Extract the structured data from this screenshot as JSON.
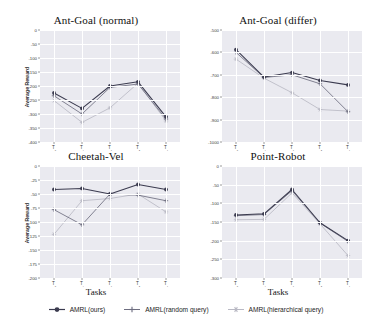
{
  "figure": {
    "background": "#ffffff",
    "panel_background": "#eaeaf0",
    "gridline_color": "#ffffff"
  },
  "legend": {
    "position": "bottom-center",
    "entries": [
      {
        "label": "AMRL(ours)",
        "color": "#3b3b4f",
        "marker": "circle"
      },
      {
        "label": "AMRL(random query)",
        "color": "#6e6e80",
        "marker": "plus"
      },
      {
        "label": "AMRL(hierarchical query)",
        "color": "#b9b9c4",
        "marker": "star"
      }
    ]
  },
  "chart_data": [
    {
      "id": "ant-goal-normal",
      "type": "line",
      "title": "Ant-Goal (normal)",
      "xlabel": "",
      "ylabel": "Average Reward",
      "categories": [
        "T₀",
        "T₁",
        "T₂",
        "T₃",
        "T₄"
      ],
      "tick_labels_x": [
        "T0",
        "T1",
        "T2",
        "T3",
        "T4"
      ],
      "ylim": [
        -400,
        0
      ],
      "yticks": [
        0,
        -50,
        -100,
        -150,
        -200,
        -250,
        -300,
        -350,
        -400
      ],
      "ytick_labels": [
        "0",
        "-50",
        "-100",
        "-150",
        "-200",
        "-250",
        "-300",
        "-350",
        "-400"
      ],
      "grid": true,
      "series": [
        {
          "name": "AMRL(ours)",
          "color": "#3b3b4f",
          "marker": "circle",
          "values": [
            -225,
            -280,
            -200,
            -185,
            -310
          ]
        },
        {
          "name": "AMRL(random query)",
          "color": "#6e6e80",
          "marker": "plus",
          "values": [
            -235,
            -300,
            -205,
            -193,
            -318
          ]
        },
        {
          "name": "AMRL(hierarchical query)",
          "color": "#b9b9c4",
          "marker": "star",
          "values": [
            -252,
            -330,
            -278,
            -190,
            -325
          ]
        }
      ]
    },
    {
      "id": "ant-goal-differ",
      "type": "line",
      "title": "Ant-Goal (differ)",
      "xlabel": "",
      "ylabel": "",
      "categories": [
        "T₀",
        "T₁",
        "T₂",
        "T₃",
        "T₄"
      ],
      "tick_labels_x": [
        "T0",
        "T1",
        "T2",
        "T3",
        "T4"
      ],
      "ylim": [
        -1000,
        -500
      ],
      "yticks": [
        -500,
        -600,
        -700,
        -800,
        -900,
        -1000
      ],
      "ytick_labels": [
        "-500",
        "-600",
        "-700",
        "-800",
        "-900",
        "-1000"
      ],
      "grid": true,
      "series": [
        {
          "name": "AMRL(ours)",
          "color": "#3b3b4f",
          "marker": "circle",
          "values": [
            -588,
            -710,
            -690,
            -725,
            -745
          ]
        },
        {
          "name": "AMRL(random query)",
          "color": "#6e6e80",
          "marker": "plus",
          "values": [
            -600,
            -712,
            -700,
            -740,
            -865
          ]
        },
        {
          "name": "AMRL(hierarchical query)",
          "color": "#b9b9c4",
          "marker": "star",
          "values": [
            -630,
            -715,
            -780,
            -855,
            -862
          ]
        }
      ]
    },
    {
      "id": "cheetah-vel",
      "type": "line",
      "title": "Cheetah-Vel",
      "xlabel": "Tasks",
      "ylabel": "Average Reward",
      "categories": [
        "T₀",
        "T₁",
        "T₂",
        "T₃",
        "T₄"
      ],
      "tick_labels_x": [
        "T0",
        "T1",
        "T2",
        "T3",
        "T4"
      ],
      "ylim": [
        -200,
        0
      ],
      "yticks": [
        0,
        -25,
        -50,
        -75,
        -100,
        -125,
        -150,
        -175,
        -200
      ],
      "ytick_labels": [
        "0",
        "-25",
        "-50",
        "-75",
        "-100",
        "-125",
        "-150",
        "-175",
        "-200"
      ],
      "grid": true,
      "series": [
        {
          "name": "AMRL(ours)",
          "color": "#3b3b4f",
          "marker": "circle",
          "values": [
            -42,
            -40,
            -50,
            -33,
            -42
          ]
        },
        {
          "name": "AMRL(random query)",
          "color": "#6e6e80",
          "marker": "plus",
          "values": [
            -78,
            -105,
            -50,
            -52,
            -62
          ]
        },
        {
          "name": "AMRL(hierarchical query)",
          "color": "#b9b9c4",
          "marker": "star",
          "values": [
            -122,
            -62,
            -58,
            -50,
            -82
          ]
        }
      ]
    },
    {
      "id": "point-robot",
      "type": "line",
      "title": "Point-Robot",
      "xlabel": "Tasks",
      "ylabel": "",
      "categories": [
        "T₀",
        "T₁",
        "T₂",
        "T₃",
        "T₄"
      ],
      "tick_labels_x": [
        "T0",
        "T1",
        "T2",
        "T3",
        "T4"
      ],
      "ylim": [
        -300,
        0
      ],
      "yticks": [
        0,
        -50,
        -100,
        -150,
        -200,
        -250,
        -300
      ],
      "ytick_labels": [
        "0",
        "-50",
        "-100",
        "-150",
        "-200",
        "-250",
        "-300"
      ],
      "grid": true,
      "series": [
        {
          "name": "AMRL(ours)",
          "color": "#3b3b4f",
          "marker": "circle",
          "values": [
            -131,
            -128,
            -63,
            -152,
            -200
          ]
        },
        {
          "name": "AMRL(random query)",
          "color": "#6e6e80",
          "marker": "plus",
          "values": [
            -133,
            -130,
            -66,
            -153,
            -202
          ]
        },
        {
          "name": "AMRL(hierarchical query)",
          "color": "#b9b9c4",
          "marker": "star",
          "values": [
            -144,
            -143,
            -72,
            -155,
            -240
          ]
        }
      ]
    }
  ]
}
